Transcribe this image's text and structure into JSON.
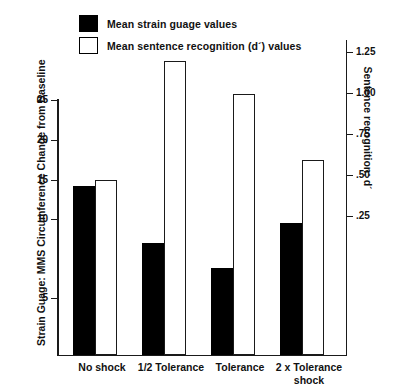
{
  "legend": {
    "items": [
      {
        "label": "Mean strain guage values",
        "swatch": "filled",
        "color": "#000000"
      },
      {
        "label": "Mean sentence recognition (d´) values",
        "swatch": "hollow",
        "color": "#ffffff"
      }
    ]
  },
  "axes": {
    "left": {
      "title": "Strain Guage: MMS Circumference Change from Baseline",
      "ticks": [
        "25",
        "20",
        "15",
        "10",
        "5"
      ]
    },
    "right": {
      "title": "Sentence recognition: d´",
      "ticks": [
        "1.25",
        "1.00",
        ".75",
        ".50",
        ".25"
      ]
    }
  },
  "chart_data": {
    "type": "bar",
    "title": "",
    "xlabel": "",
    "ylabel": "Strain Guage: MMS Circumference Change from Baseline",
    "y2label": "Sentence recognition: d´",
    "categories": [
      "No shock",
      "1/2 Tolerance",
      "Tolerance",
      "2 x Tolerance\nshock"
    ],
    "series": [
      {
        "name": "Mean strain guage values",
        "axis": "left",
        "color": "#000000",
        "values": [
          16.3,
          10.5,
          8.0,
          12.6
        ]
      },
      {
        "name": "Mean sentence recognition (d´) values",
        "axis": "right",
        "color": "#ffffff",
        "values": [
          0.3,
          1.18,
          0.93,
          0.46
        ]
      }
    ],
    "ylim": [
      0,
      26.5
    ],
    "y2lim": [
      0,
      1.37
    ],
    "ytick_values": [
      25,
      20,
      15,
      10,
      5
    ],
    "y2tick_values": [
      1.25,
      1.0,
      0.75,
      0.5,
      0.25
    ],
    "grid": false,
    "legend_position": "top-center"
  },
  "geometry": {
    "plot_left": 57,
    "plot_right": 347,
    "baseline_y": 355,
    "bar_width": 22,
    "bars": [
      {
        "x": 73,
        "top": 186,
        "kind": "black"
      },
      {
        "x": 95,
        "top": 180,
        "kind": "white"
      },
      {
        "x": 142,
        "top": 243,
        "kind": "black"
      },
      {
        "x": 164,
        "top": 61,
        "kind": "white"
      },
      {
        "x": 211,
        "top": 268,
        "kind": "black"
      },
      {
        "x": 233,
        "top": 94,
        "kind": "white"
      },
      {
        "x": 280,
        "top": 223,
        "kind": "black"
      },
      {
        "x": 302,
        "top": 160,
        "kind": "white"
      }
    ],
    "left_tick_y": [
      100,
      140,
      180,
      219,
      298
    ],
    "right_tick_y": [
      52,
      93,
      134,
      175,
      216
    ],
    "category_x": [
      62,
      131,
      200,
      269
    ]
  }
}
